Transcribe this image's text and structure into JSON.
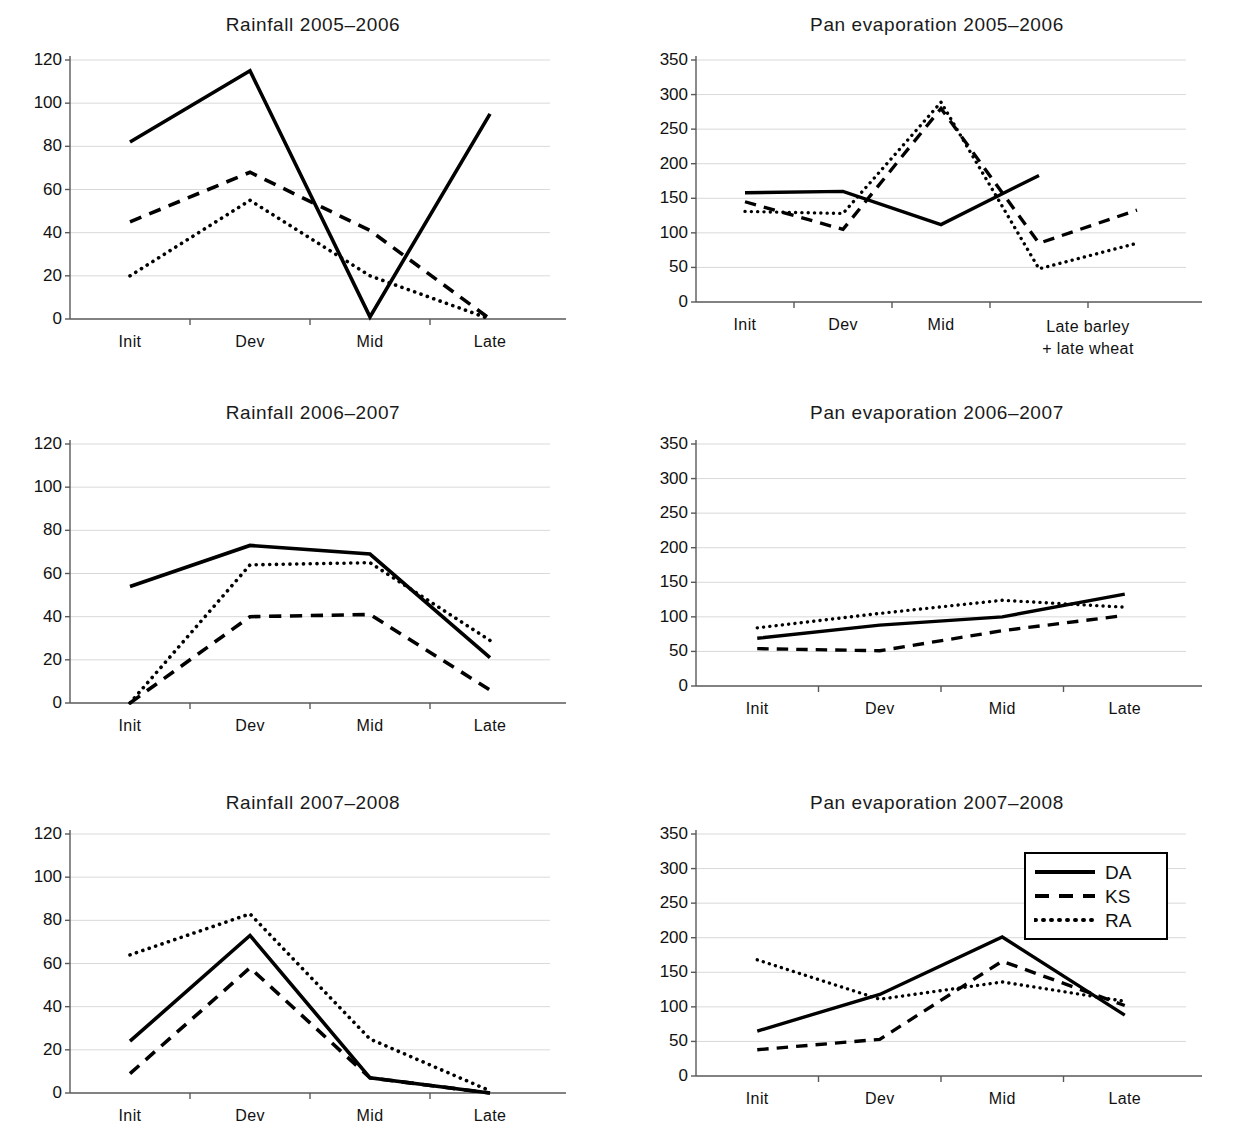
{
  "figure": {
    "background": "#ffffff",
    "line_color": "#000000",
    "grid_color": "#d9d9d9",
    "axis_color": "#595959"
  },
  "legend": {
    "position": "top-right of bottom-right panel",
    "entries": [
      {
        "label": "DA",
        "style": "solid"
      },
      {
        "label": "KS",
        "style": "dashed"
      },
      {
        "label": "RA",
        "style": "dotted"
      }
    ]
  },
  "caption": {
    "text": ""
  },
  "chart_data": [
    {
      "id": "rainfall-2005-2006",
      "type": "line",
      "title": "Rainfall 2005–2006",
      "xlabel": "",
      "ylabel": "",
      "categories": [
        "Init",
        "Dev",
        "Mid",
        "Late"
      ],
      "tick_labels": [
        "Init",
        "Dev",
        "Mid",
        "Late"
      ],
      "yticks": [
        0,
        20,
        40,
        60,
        80,
        100,
        120
      ],
      "ylim": [
        0,
        120
      ],
      "grid": true,
      "legend": false,
      "series": [
        {
          "name": "DA",
          "style": "solid",
          "values": [
            82,
            115,
            1,
            95
          ]
        },
        {
          "name": "KS",
          "style": "dashed",
          "values": [
            45,
            68,
            41,
            0
          ]
        },
        {
          "name": "RA",
          "style": "dotted",
          "values": [
            20,
            55,
            20,
            0
          ]
        }
      ]
    },
    {
      "id": "pan-evaporation-2005-2006",
      "type": "line",
      "title": "Pan evaporation 2005–2006",
      "xlabel": "",
      "ylabel": "",
      "categories": [
        "Init",
        "Dev",
        "Mid",
        "Late barley",
        "late wheat"
      ],
      "tick_labels": [
        "Init",
        "Dev",
        "Mid",
        "Late barley\n+ late wheat"
      ],
      "yticks": [
        0,
        50,
        100,
        150,
        200,
        250,
        300,
        350
      ],
      "ylim": [
        0,
        350
      ],
      "grid": true,
      "legend": false,
      "series": [
        {
          "name": "DA",
          "style": "solid",
          "values": [
            158,
            160,
            112,
            183,
            null
          ]
        },
        {
          "name": "KS",
          "style": "dashed",
          "values": [
            145,
            105,
            280,
            85,
            133
          ]
        },
        {
          "name": "RA",
          "style": "dotted",
          "values": [
            131,
            128,
            289,
            48,
            85
          ]
        }
      ]
    },
    {
      "id": "rainfall-2006-2007",
      "type": "line",
      "title": "Rainfall 2006–2007",
      "xlabel": "",
      "ylabel": "",
      "categories": [
        "Init",
        "Dev",
        "Mid",
        "Late"
      ],
      "tick_labels": [
        "Init",
        "Dev",
        "Mid",
        "Late"
      ],
      "yticks": [
        0,
        20,
        40,
        60,
        80,
        100,
        120
      ],
      "ylim": [
        0,
        120
      ],
      "grid": true,
      "legend": false,
      "series": [
        {
          "name": "DA",
          "style": "solid",
          "values": [
            54,
            73,
            69,
            21
          ]
        },
        {
          "name": "KS",
          "style": "dashed",
          "values": [
            0,
            40,
            41,
            6
          ]
        },
        {
          "name": "RA",
          "style": "dotted",
          "values": [
            0,
            64,
            65,
            29
          ]
        }
      ]
    },
    {
      "id": "pan-evaporation-2006-2007",
      "type": "line",
      "title": "Pan evaporation 2006–2007",
      "xlabel": "",
      "ylabel": "",
      "categories": [
        "Init",
        "Dev",
        "Mid",
        "Late"
      ],
      "tick_labels": [
        "Init",
        "Dev",
        "Mid",
        "Late"
      ],
      "yticks": [
        0,
        50,
        100,
        150,
        200,
        250,
        300,
        350
      ],
      "ylim": [
        0,
        350
      ],
      "grid": true,
      "legend": false,
      "series": [
        {
          "name": "DA",
          "style": "solid",
          "values": [
            69,
            88,
            100,
            133
          ]
        },
        {
          "name": "KS",
          "style": "dashed",
          "values": [
            54,
            51,
            80,
            102
          ]
        },
        {
          "name": "RA",
          "style": "dotted",
          "values": [
            84,
            105,
            124,
            114
          ]
        }
      ]
    },
    {
      "id": "rainfall-2007-2008",
      "type": "line",
      "title": "Rainfall 2007–2008",
      "xlabel": "",
      "ylabel": "",
      "categories": [
        "Init",
        "Dev",
        "Mid",
        "Late"
      ],
      "tick_labels": [
        "Init",
        "Dev",
        "Mid",
        "Late"
      ],
      "yticks": [
        0,
        20,
        40,
        60,
        80,
        100,
        120
      ],
      "ylim": [
        0,
        120
      ],
      "grid": true,
      "legend": false,
      "series": [
        {
          "name": "DA",
          "style": "solid",
          "values": [
            24,
            73,
            7,
            0
          ]
        },
        {
          "name": "KS",
          "style": "dashed",
          "values": [
            9,
            58,
            7,
            0
          ]
        },
        {
          "name": "RA",
          "style": "dotted",
          "values": [
            64,
            83,
            25,
            1
          ]
        }
      ]
    },
    {
      "id": "pan-evaporation-2007-2008",
      "type": "line",
      "title": "Pan evaporation 2007–2008",
      "xlabel": "",
      "ylabel": "",
      "categories": [
        "Init",
        "Dev",
        "Mid",
        "Late"
      ],
      "tick_labels": [
        "Init",
        "Dev",
        "Mid",
        "Late"
      ],
      "yticks": [
        0,
        50,
        100,
        150,
        200,
        250,
        300,
        350
      ],
      "ylim": [
        0,
        350
      ],
      "grid": true,
      "legend": true,
      "series": [
        {
          "name": "DA",
          "style": "solid",
          "values": [
            65,
            118,
            201,
            88
          ]
        },
        {
          "name": "KS",
          "style": "dashed",
          "values": [
            38,
            53,
            166,
            102
          ]
        },
        {
          "name": "RA",
          "style": "dotted",
          "values": [
            168,
            111,
            136,
            108
          ]
        }
      ]
    }
  ]
}
